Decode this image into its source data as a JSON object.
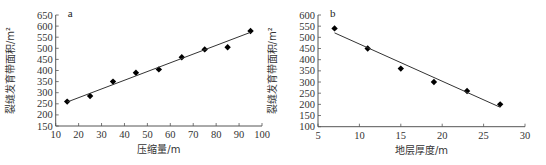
{
  "chart_data": [
    {
      "type": "scatter",
      "panel_label": "a",
      "title": "",
      "xlabel": "压缩量/m",
      "ylabel": "裂缝发育带面积/m²",
      "xlim": [
        10,
        100
      ],
      "ylim": [
        150,
        650
      ],
      "xticks": [
        10,
        20,
        30,
        40,
        50,
        60,
        70,
        80,
        90,
        100
      ],
      "yticks": [
        150,
        200,
        250,
        300,
        350,
        400,
        450,
        500,
        550,
        600,
        650
      ],
      "grid": false,
      "legend": null,
      "series": [
        {
          "name": "observed",
          "marker": "diamond",
          "x": [
            15,
            25,
            35,
            45,
            55,
            65,
            75,
            85,
            95
          ],
          "y": [
            260,
            285,
            350,
            390,
            405,
            460,
            495,
            505,
            578
          ]
        },
        {
          "name": "linear fit",
          "type": "line",
          "x": [
            15,
            95
          ],
          "y": [
            258,
            572
          ]
        }
      ]
    },
    {
      "type": "scatter",
      "panel_label": "b",
      "title": "",
      "xlabel": "地层厚度/m",
      "ylabel": "裂缝发育带面积/m²",
      "xlim": [
        5,
        30
      ],
      "ylim": [
        100,
        600
      ],
      "xticks": [
        5,
        10,
        15,
        20,
        25,
        30
      ],
      "yticks": [
        100,
        150,
        200,
        250,
        300,
        350,
        400,
        450,
        500,
        550,
        600
      ],
      "grid": false,
      "legend": null,
      "series": [
        {
          "name": "observed",
          "marker": "diamond",
          "x": [
            7,
            11,
            15,
            19,
            23,
            27
          ],
          "y": [
            540,
            450,
            360,
            300,
            260,
            200
          ]
        },
        {
          "name": "linear fit",
          "type": "line",
          "x": [
            7,
            27
          ],
          "y": [
            520,
            187
          ]
        }
      ]
    }
  ],
  "panels": [
    {
      "frame": {
        "left": 55.7,
        "right": 262,
        "top": 15,
        "bottom": 126
      }
    },
    {
      "frame": {
        "left": 318,
        "right": 525,
        "top": 15,
        "bottom": 126.7
      }
    }
  ],
  "colors": {
    "axis": "#555555",
    "marker": "#000000",
    "line": "#333333",
    "text": "#333333"
  }
}
